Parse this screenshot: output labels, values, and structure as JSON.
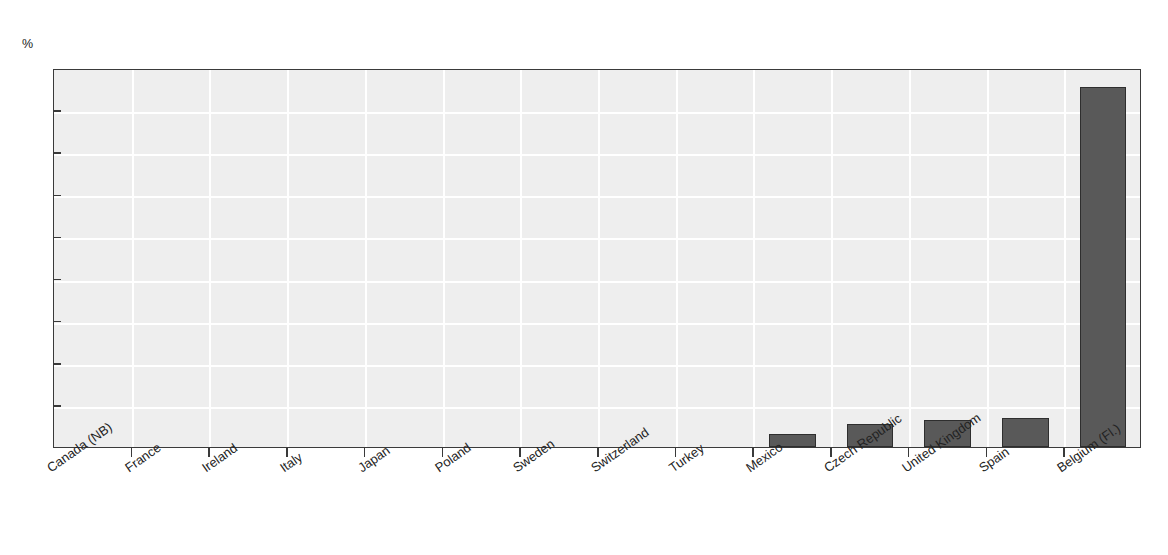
{
  "figure": {
    "title": "",
    "unit_label": "%"
  },
  "chart_data": {
    "type": "bar",
    "title": "",
    "xlabel": "",
    "ylabel": "%",
    "ylim": [
      0,
      18
    ],
    "ytick_step": 2,
    "yticks": [
      0,
      2,
      4,
      6,
      8,
      10,
      12,
      14,
      16,
      18
    ],
    "grid": true,
    "grid_color": "#ffffff",
    "plot_background": "#eeeeee",
    "bar_color": "#595959",
    "bar_edge_color": "#2e2e2e",
    "legend": null,
    "categories": [
      "Canada (NB)",
      "France",
      "Ireland",
      "Italy",
      "Japan",
      "Poland",
      "Sweden",
      "Switzerland",
      "Turkey",
      "Mexico",
      "Czech Republic",
      "United Kingdom",
      "Spain",
      "Belgium (Fl.)"
    ],
    "values": [
      0,
      0,
      0,
      0,
      0,
      0,
      0,
      0,
      0,
      0.6,
      1.1,
      1.3,
      1.4,
      17.1
    ]
  }
}
